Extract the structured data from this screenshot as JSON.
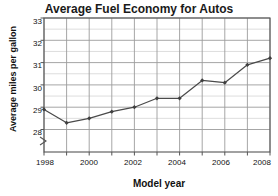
{
  "chart_data": {
    "type": "line",
    "title": "Average Fuel Economy for Autos",
    "xlabel": "Model year",
    "ylabel": "Average miles per gallon",
    "x": [
      1998,
      1999,
      2000,
      2001,
      2002,
      2003,
      2004,
      2005,
      2006,
      2007,
      2008
    ],
    "values": [
      28.9,
      28.3,
      28.5,
      28.8,
      29.0,
      29.4,
      29.4,
      30.2,
      30.1,
      30.9,
      31.2
    ],
    "series": [
      {
        "name": "Average miles per gallon",
        "values": [
          28.9,
          28.3,
          28.5,
          28.8,
          29.0,
          29.4,
          29.4,
          30.2,
          30.1,
          30.9,
          31.2
        ]
      }
    ],
    "ylim": [
      27.6,
      33
    ],
    "xlim": [
      1998,
      2008
    ],
    "yticks": [
      28,
      29,
      30,
      31,
      32,
      33
    ],
    "ytick_labels": [
      "28",
      "29",
      "30",
      "31",
      "32",
      "33"
    ],
    "xticks": [
      1998,
      1999,
      2000,
      2001,
      2002,
      2003,
      2004,
      2005,
      2006,
      2007,
      2008
    ],
    "xtick_labels": [
      "1998",
      "",
      "2000",
      "",
      "2002",
      "",
      "2004",
      "",
      "2006",
      "",
      "2008"
    ],
    "xtick_labels_shown": [
      "1998",
      "2000",
      "2002",
      "2004",
      "2006",
      "2008"
    ],
    "grid": "both",
    "minor_grid_step_y": 0.5,
    "legend": "none",
    "axis_break": "y-axis break below 28",
    "marker": "filled-diamond",
    "line_color": "#4a4a4a",
    "grid_color": "#b9b9b9",
    "axis_color": "#555555",
    "text_color": "#111111",
    "background": "#ffffff"
  }
}
